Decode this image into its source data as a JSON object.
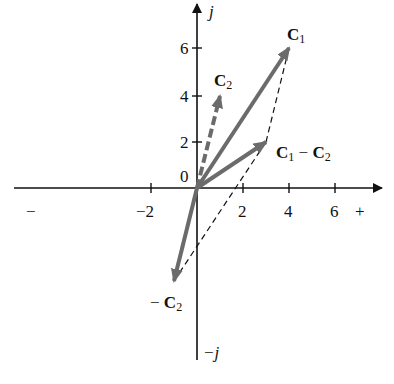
{
  "diagram": {
    "type": "complex-plane vector subtraction",
    "axes": {
      "real_positive_label": "+",
      "real_negative_label": "−",
      "imag_positive_label": "j",
      "imag_negative_label": "−j",
      "origin_label": "0",
      "x_ticks": [
        "−2",
        "2",
        "4",
        "6"
      ],
      "y_ticks": [
        "2",
        "4",
        "6"
      ]
    },
    "vectors": [
      {
        "name": "C1",
        "label_main": "C",
        "label_sub": "1",
        "from": [
          0,
          0
        ],
        "to": [
          4,
          6
        ],
        "style": "solid"
      },
      {
        "name": "C2",
        "label_main": "C",
        "label_sub": "2",
        "from": [
          0,
          0
        ],
        "to": [
          1,
          4
        ],
        "style": "dashed"
      },
      {
        "name": "C1 − C2",
        "label_main": "C",
        "label_sub": "1",
        "label_op": " − ",
        "label_main2": "C",
        "label_sub2": "2",
        "from": [
          0,
          0
        ],
        "to": [
          3,
          2
        ],
        "style": "solid"
      },
      {
        "name": "−C2",
        "label_prefix": "− ",
        "label_main": "C",
        "label_sub": "2",
        "from": [
          0,
          0
        ],
        "to": [
          -1,
          -4
        ],
        "style": "solid"
      }
    ],
    "construction_lines": [
      {
        "from": [
          3,
          2
        ],
        "to": [
          4,
          6
        ],
        "style": "dashed"
      },
      {
        "from": [
          -1,
          -4
        ],
        "to": [
          3,
          2
        ],
        "style": "dashed"
      }
    ],
    "colors": {
      "axis": "#111111",
      "vector": "#6b6b6b",
      "construction": "#111111"
    }
  }
}
